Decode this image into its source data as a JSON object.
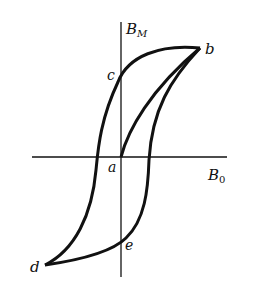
{
  "diagram": {
    "axes": {
      "y_label": "B",
      "y_label_sub": "M",
      "x_label": "B",
      "x_label_sub": "0"
    },
    "points": {
      "a": "a",
      "b": "b",
      "c": "c",
      "d": "d",
      "e": "e"
    },
    "colors": {
      "stroke": "#111111",
      "background": "#ffffff"
    }
  }
}
